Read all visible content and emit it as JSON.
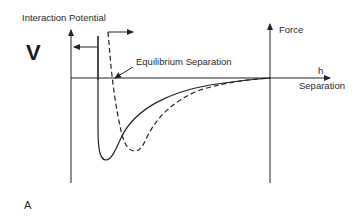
{
  "figure": {
    "y_axis_label": "Interaction Potential",
    "v_symbol": "V",
    "force_axis_label": "Force",
    "x_axis_symbol": "h",
    "x_axis_label": "Separation",
    "annotation": "Equilibrium Separation",
    "panel_label": "A",
    "colors": {
      "line": "#222222",
      "background": "#ffffff"
    },
    "curves": [
      {
        "name": "solid-potential-curve",
        "style": "solid"
      },
      {
        "name": "dashed-potential-curve",
        "style": "dashed"
      }
    ]
  }
}
